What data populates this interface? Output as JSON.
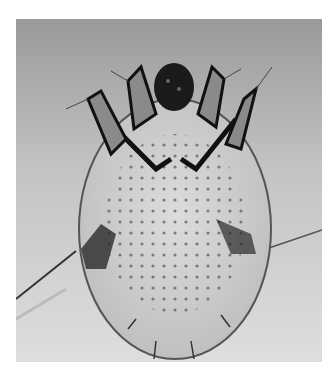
{
  "image": {
    "subject": "Micrograph of a mite (dorsal view)",
    "style": "grayscale light microscopy",
    "colors": {
      "background_top": "#9a9a9a",
      "background_bottom": "#dcdcdc",
      "body": "#d0d0d0",
      "outline": "#1a1a1a",
      "page": "#ffffff"
    }
  }
}
